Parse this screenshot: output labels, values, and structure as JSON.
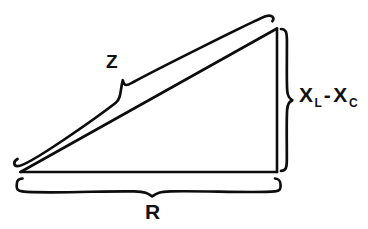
{
  "figure": {
    "background_color": "#ffffff",
    "stroke_color": "#0d0d0d",
    "labels": {
      "hypotenuse": "Z",
      "base": "R",
      "vertical_symbol": "X",
      "vertical_sub_1": "L",
      "vertical_minus": "-",
      "vertical_symbol_2": "X",
      "vertical_sub_2": "C",
      "vertical_full": "X L - X C"
    },
    "geometry": {
      "left_vertex": "20,172",
      "right_vertex": "276,172",
      "apex": "276,28"
    },
    "braces": {
      "hypotenuse_brace": "curly brace along hypotenuse, tip near 123,80",
      "vertical_brace": "curly brace right of vertical leg, tip near 292,100",
      "base_brace": "curly brace below base, tip near 152,196"
    }
  }
}
